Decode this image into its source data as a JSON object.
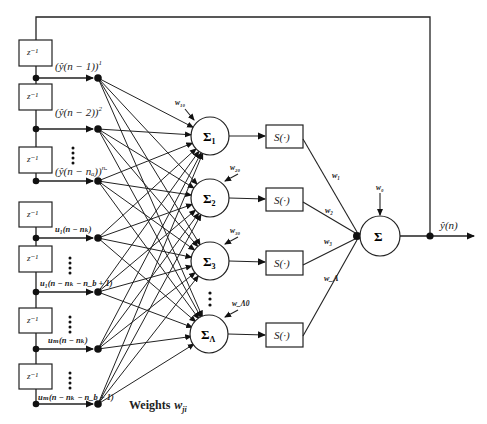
{
  "diagram": {
    "delay_label": "z⁻¹",
    "delay_boxes": [
      {
        "id": "d1",
        "y": 40,
        "tap_y": 78,
        "tap_label": "(ŷ(n − 1))¹",
        "sup": "1"
      },
      {
        "id": "d2",
        "y": 84,
        "tap_y": 129,
        "tap_label": "(ŷ(n − 2))²",
        "sup": "2"
      },
      {
        "id": "d3",
        "y": 147,
        "tap_y": 181,
        "tap_label": "(ŷ(n − nₐ))^nₐ",
        "sup": "na"
      },
      {
        "id": "d4",
        "y": 202,
        "tap_y": 238,
        "tap_label": "u₁(n − n_k)"
      },
      {
        "id": "d5",
        "y": 246,
        "tap_y": 292,
        "tap_label": "u₁(n − n_k − n_b + 1)"
      },
      {
        "id": "d6",
        "y": 308,
        "tap_y": 349,
        "tap_label": "u_m(n − n_k)"
      },
      {
        "id": "d7",
        "y": 364,
        "tap_y": 404,
        "tap_label": "u_m(n − n_k − n_b + 1)"
      }
    ],
    "tap_labels": {
      "y1": "(ŷ(n − 1))",
      "y1_sup": "1",
      "y2": "(ŷ(n − 2))",
      "y2_sup": "2",
      "yna": "(ŷ(n − nₐ))",
      "yna_sup": "nₐ",
      "u1_nk": "u₁(n − nₖ)",
      "u1_last": "u₁(n − nₖ − n_b + 1)",
      "um_nk": "uₘ(n − nₖ)",
      "um_last": "uₘ(n − nₖ − n_b + 1)"
    },
    "ellipsis": "⋮",
    "hidden_nodes": [
      {
        "id": "h1",
        "label": "Σ",
        "sub": "1",
        "bias": "w₁₀",
        "cy": 136
      },
      {
        "id": "h2",
        "label": "Σ",
        "sub": "2",
        "bias": "w₂₀",
        "cy": 198
      },
      {
        "id": "h3",
        "label": "Σ",
        "sub": "3",
        "bias": "w₃₀",
        "cy": 261
      },
      {
        "id": "hL",
        "label": "Σ",
        "sub": "Λ",
        "bias": "w_Λ0",
        "cy": 334
      }
    ],
    "activation_label": "S(·)",
    "output_weights": [
      "w₁",
      "w₂",
      "w₃",
      "w_Λ"
    ],
    "output_node": {
      "label": "Σ",
      "bias": "w₀"
    },
    "output_label": "ŷ(n)",
    "weights_caption": "Weights",
    "weights_symbol": "w",
    "weights_sub": "ji"
  }
}
